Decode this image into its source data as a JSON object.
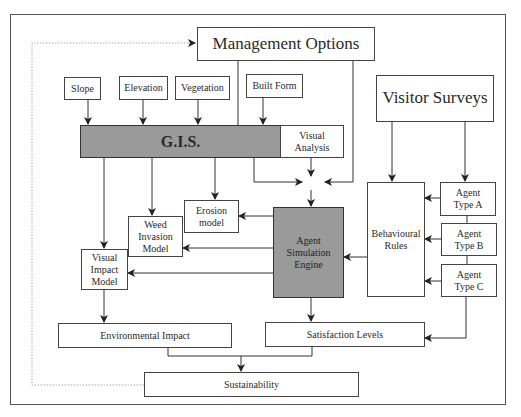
{
  "diagram": {
    "nodes": {
      "management_options": "Management Options",
      "slope": "Slope",
      "elevation": "Elevation",
      "vegetation": "Vegetation",
      "built_form": "Built Form",
      "gis": "G.I.S.",
      "visual_analysis": "Visual\nAnalysis",
      "visitor_surveys": "Visitor Surveys",
      "behavioural_rules": "Behavioural\nRules",
      "agent_type_a": "Agent\nType A",
      "agent_type_b": "Agent\nType B",
      "agent_type_c": "Agent\nType C",
      "erosion_model": "Erosion\nmodel",
      "weed_invasion_model": "Weed\nInvasion\nModel",
      "visual_impact_model": "Visual\nImpact\nModel",
      "agent_simulation_engine": "Agent\nSimulation\nEngine",
      "environmental_impact": "Environmental Impact",
      "satisfaction_levels": "Satisfaction Levels",
      "sustainability": "Sustainability"
    },
    "edges": [
      {
        "from": "slope",
        "to": "gis"
      },
      {
        "from": "elevation",
        "to": "gis"
      },
      {
        "from": "vegetation",
        "to": "gis"
      },
      {
        "from": "built_form",
        "to": "gis"
      },
      {
        "from": "management_options",
        "to": "gis"
      },
      {
        "from": "management_options",
        "to": "agent_simulation_engine"
      },
      {
        "from": "gis",
        "to": "agent_simulation_engine"
      },
      {
        "from": "visual_analysis",
        "to": "agent_simulation_engine"
      },
      {
        "from": "gis",
        "to": "visual_impact_model"
      },
      {
        "from": "gis",
        "to": "weed_invasion_model"
      },
      {
        "from": "gis",
        "to": "erosion_model"
      },
      {
        "from": "agent_simulation_engine",
        "to": "erosion_model"
      },
      {
        "from": "agent_simulation_engine",
        "to": "weed_invasion_model"
      },
      {
        "from": "agent_simulation_engine",
        "to": "visual_impact_model"
      },
      {
        "from": "visitor_surveys",
        "to": "behavioural_rules"
      },
      {
        "from": "visitor_surveys",
        "to": "agent_type_a"
      },
      {
        "from": "agent_type_a",
        "to": "behavioural_rules"
      },
      {
        "from": "agent_type_b",
        "to": "behavioural_rules"
      },
      {
        "from": "agent_type_c",
        "to": "behavioural_rules"
      },
      {
        "from": "behavioural_rules",
        "to": "agent_simulation_engine"
      },
      {
        "from": "agent_type_c",
        "to": "satisfaction_levels"
      },
      {
        "from": "agent_simulation_engine",
        "to": "satisfaction_levels"
      },
      {
        "from": "visual_impact_model",
        "to": "environmental_impact"
      },
      {
        "from": "environmental_impact",
        "to": "sustainability"
      },
      {
        "from": "satisfaction_levels",
        "to": "sustainability"
      },
      {
        "from": "sustainability",
        "to": "management_options",
        "style": "dotted-feedback"
      }
    ],
    "colors": {
      "highlight_fill": "#9a9a9a",
      "line": "#333333",
      "feedback_line": "#aaaaaa"
    }
  }
}
